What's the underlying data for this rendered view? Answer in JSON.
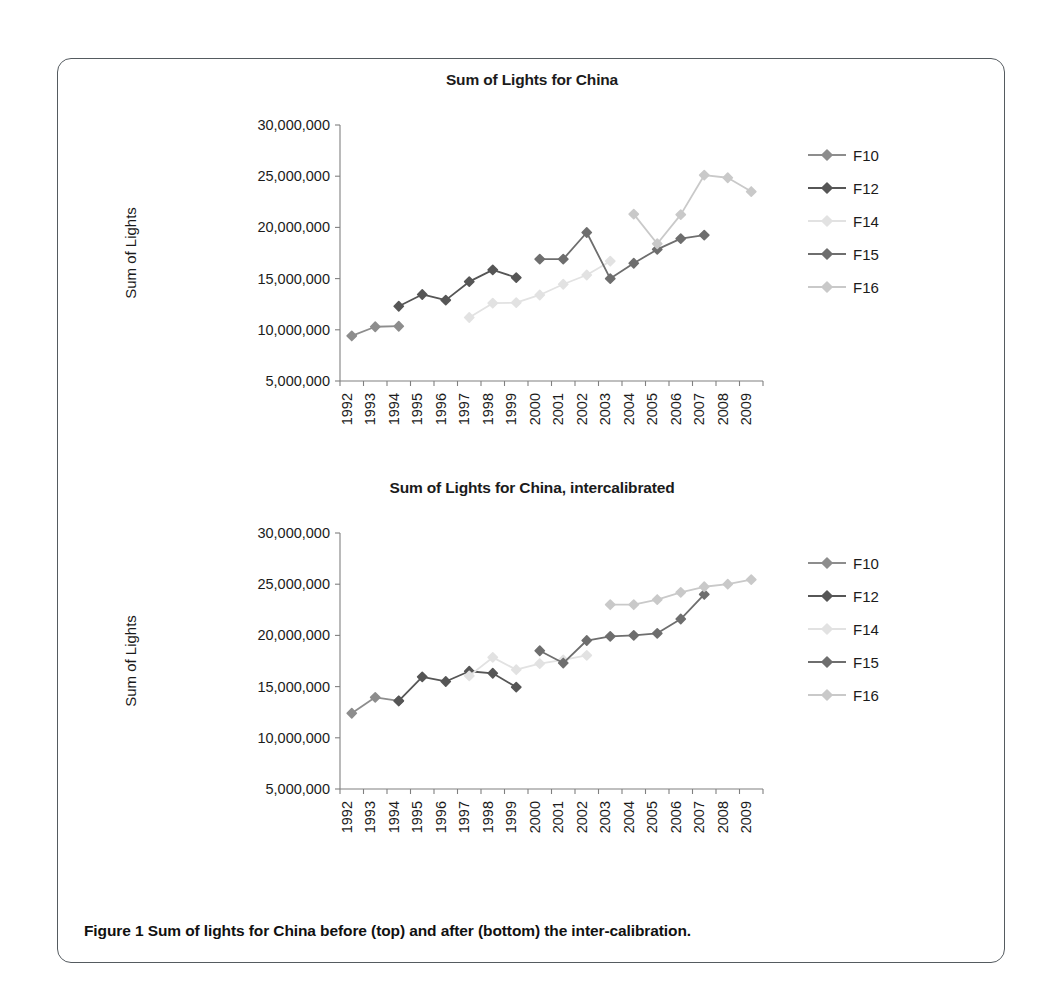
{
  "figure": {
    "caption": "Figure 1  Sum of lights for China before (top) and after (bottom) the inter-calibration."
  },
  "colors": {
    "F10": "#8d8d8d",
    "F12": "#565656",
    "F14": "#e2e2e2",
    "F15": "#6e6e6e",
    "F16": "#c9c9c9",
    "axis": "#808080",
    "text": "#1b1b1b"
  },
  "charts": [
    {
      "id": "top",
      "title": "Sum of Lights for China",
      "xlabel": "Year",
      "ylabel": "Sum of Lights"
    },
    {
      "id": "bottom",
      "title": "Sum of Lights for China, intercalibrated",
      "xlabel": "Year",
      "ylabel": "Sum of Lights"
    }
  ],
  "legend": {
    "entries": [
      "F10",
      "F12",
      "F14",
      "F15",
      "F16"
    ]
  },
  "chart_data": [
    {
      "type": "line",
      "title": "Sum of Lights for China",
      "xlabel": "Year",
      "ylabel": "Sum of Lights",
      "x": [
        1992,
        1993,
        1994,
        1995,
        1996,
        1997,
        1998,
        1999,
        2000,
        2001,
        2002,
        2003,
        2004,
        2005,
        2006,
        2007,
        2008,
        2009
      ],
      "ytick_labels": [
        "5,000,000",
        "10,000,000",
        "15,000,000",
        "20,000,000",
        "25,000,000",
        "30,000,000"
      ],
      "ylim": [
        5000000,
        30000000
      ],
      "ytick_step": 5000000,
      "grid": false,
      "legend_position": "right",
      "series": [
        {
          "name": "F10",
          "color": "#8d8d8d",
          "points": [
            {
              "x": 1992,
              "y": 9400000
            },
            {
              "x": 1993,
              "y": 10300000
            },
            {
              "x": 1994,
              "y": 10350000
            }
          ]
        },
        {
          "name": "F12",
          "color": "#565656",
          "points": [
            {
              "x": 1994,
              "y": 12300000
            },
            {
              "x": 1995,
              "y": 13450000
            },
            {
              "x": 1996,
              "y": 12900000
            },
            {
              "x": 1997,
              "y": 14700000
            },
            {
              "x": 1998,
              "y": 15850000
            },
            {
              "x": 1999,
              "y": 15100000
            }
          ]
        },
        {
          "name": "F14",
          "color": "#e2e2e2",
          "points": [
            {
              "x": 1997,
              "y": 11200000
            },
            {
              "x": 1998,
              "y": 12600000
            },
            {
              "x": 1999,
              "y": 12650000
            },
            {
              "x": 2000,
              "y": 13400000
            },
            {
              "x": 2001,
              "y": 14450000
            },
            {
              "x": 2002,
              "y": 15350000
            },
            {
              "x": 2003,
              "y": 16700000
            }
          ]
        },
        {
          "name": "F15",
          "color": "#6e6e6e",
          "points": [
            {
              "x": 2000,
              "y": 16900000
            },
            {
              "x": 2001,
              "y": 16900000
            },
            {
              "x": 2002,
              "y": 19500000
            },
            {
              "x": 2003,
              "y": 15000000
            },
            {
              "x": 2004,
              "y": 16500000
            },
            {
              "x": 2005,
              "y": 17850000
            },
            {
              "x": 2006,
              "y": 18900000
            },
            {
              "x": 2007,
              "y": 19250000
            }
          ]
        },
        {
          "name": "F16",
          "color": "#c9c9c9",
          "points": [
            {
              "x": 2004,
              "y": 21300000
            },
            {
              "x": 2005,
              "y": 18400000
            },
            {
              "x": 2006,
              "y": 21250000
            },
            {
              "x": 2007,
              "y": 25100000
            },
            {
              "x": 2008,
              "y": 24850000
            },
            {
              "x": 2009,
              "y": 23500000
            }
          ]
        }
      ]
    },
    {
      "type": "line",
      "title": "Sum of Lights for China, intercalibrated",
      "xlabel": "Year",
      "ylabel": "Sum of Lights",
      "x": [
        1992,
        1993,
        1994,
        1995,
        1996,
        1997,
        1998,
        1999,
        2000,
        2001,
        2002,
        2003,
        2004,
        2005,
        2006,
        2007,
        2008,
        2009
      ],
      "ytick_labels": [
        "5,000,000",
        "10,000,000",
        "15,000,000",
        "20,000,000",
        "25,000,000",
        "30,000,000"
      ],
      "ylim": [
        5000000,
        30000000
      ],
      "ytick_step": 5000000,
      "grid": false,
      "legend_position": "right",
      "series": [
        {
          "name": "F10",
          "color": "#8d8d8d",
          "points": [
            {
              "x": 1992,
              "y": 12400000
            },
            {
              "x": 1993,
              "y": 13950000
            },
            {
              "x": 1994,
              "y": 13600000
            }
          ]
        },
        {
          "name": "F12",
          "color": "#565656",
          "points": [
            {
              "x": 1994,
              "y": 13600000
            },
            {
              "x": 1995,
              "y": 15950000
            },
            {
              "x": 1996,
              "y": 15500000
            },
            {
              "x": 1997,
              "y": 16500000
            },
            {
              "x": 1998,
              "y": 16300000
            },
            {
              "x": 1999,
              "y": 14950000
            }
          ]
        },
        {
          "name": "F14",
          "color": "#e2e2e2",
          "points": [
            {
              "x": 1997,
              "y": 16050000
            },
            {
              "x": 1998,
              "y": 17850000
            },
            {
              "x": 1999,
              "y": 16650000
            },
            {
              "x": 2000,
              "y": 17250000
            },
            {
              "x": 2001,
              "y": 17600000
            },
            {
              "x": 2002,
              "y": 18050000
            }
          ]
        },
        {
          "name": "F15",
          "color": "#6e6e6e",
          "points": [
            {
              "x": 2000,
              "y": 18500000
            },
            {
              "x": 2001,
              "y": 17300000
            },
            {
              "x": 2002,
              "y": 19500000
            },
            {
              "x": 2003,
              "y": 19900000
            },
            {
              "x": 2004,
              "y": 20000000
            },
            {
              "x": 2005,
              "y": 20200000
            },
            {
              "x": 2006,
              "y": 21600000
            },
            {
              "x": 2007,
              "y": 24000000
            }
          ]
        },
        {
          "name": "F16",
          "color": "#c9c9c9",
          "points": [
            {
              "x": 2003,
              "y": 23000000
            },
            {
              "x": 2004,
              "y": 23000000
            },
            {
              "x": 2005,
              "y": 23500000
            },
            {
              "x": 2006,
              "y": 24200000
            },
            {
              "x": 2007,
              "y": 24750000
            },
            {
              "x": 2008,
              "y": 25000000
            },
            {
              "x": 2009,
              "y": 25450000
            }
          ]
        }
      ]
    }
  ]
}
